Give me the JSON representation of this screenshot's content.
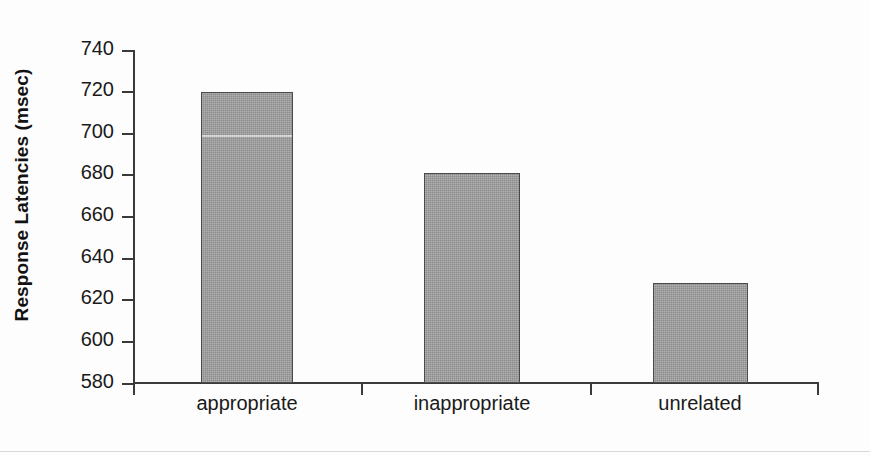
{
  "chart_data": {
    "type": "bar",
    "title": "",
    "xlabel": "",
    "ylabel": "Response Latencies (msec)",
    "categories": [
      "appropriate",
      "inappropriate",
      "unrelated"
    ],
    "values": [
      720,
      681,
      628
    ],
    "ylim": [
      580,
      740
    ],
    "yticks": [
      580,
      600,
      620,
      640,
      660,
      680,
      700,
      720,
      740
    ],
    "ytick_labels": [
      "580",
      "600",
      "620",
      "640",
      "660",
      "680",
      "700",
      "720",
      "740"
    ],
    "grid": false,
    "legend": null,
    "legend_position": "none",
    "series": [
      {
        "name": "Response latency",
        "values": [
          720,
          681,
          628
        ]
      }
    ],
    "bar_color": "#9c9c9c",
    "bar_edge_color": "#4a4a4a",
    "axis_color": "#3a3a3a",
    "background_color": "#fdfdfd",
    "text_color": "#1a1a1a"
  }
}
